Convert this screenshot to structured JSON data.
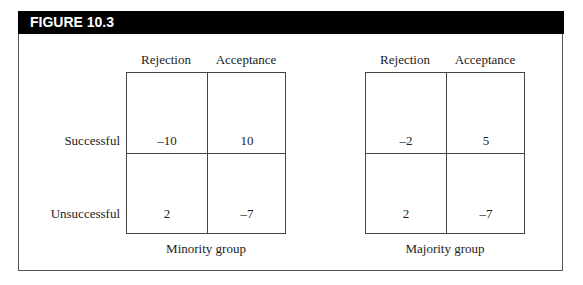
{
  "figure": {
    "title": "FIGURE 10.3"
  },
  "columns": [
    "Rejection",
    "Acceptance"
  ],
  "rows": [
    "Successful",
    "Unsuccessful"
  ],
  "matrices": [
    {
      "caption": "Minority group",
      "cells": [
        [
          "–10",
          "10"
        ],
        [
          "2",
          "–7"
        ]
      ]
    },
    {
      "caption": "Majority group",
      "cells": [
        [
          "–2",
          "5"
        ],
        [
          "2",
          "–7"
        ]
      ]
    }
  ]
}
